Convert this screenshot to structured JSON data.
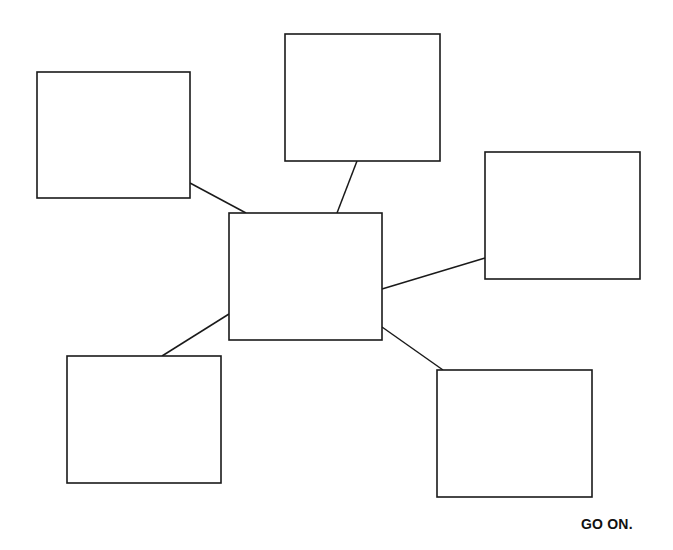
{
  "diagram": {
    "type": "web-organizer",
    "center_node": {
      "id": "center",
      "label": "",
      "x": 229,
      "y": 213,
      "w": 153,
      "h": 127
    },
    "nodes": [
      {
        "id": "top-left",
        "label": "",
        "x": 37,
        "y": 72,
        "w": 153,
        "h": 126
      },
      {
        "id": "top-center",
        "label": "",
        "x": 285,
        "y": 34,
        "w": 155,
        "h": 127
      },
      {
        "id": "right",
        "label": "",
        "x": 485,
        "y": 152,
        "w": 155,
        "h": 127
      },
      {
        "id": "bottom-left",
        "label": "",
        "x": 67,
        "y": 356,
        "w": 154,
        "h": 127
      },
      {
        "id": "bottom-right",
        "label": "",
        "x": 437,
        "y": 370,
        "w": 155,
        "h": 127
      }
    ],
    "edges": [
      {
        "from": "center",
        "to": "top-left",
        "x1": 246,
        "y1": 213,
        "x2": 190,
        "y2": 183
      },
      {
        "from": "center",
        "to": "top-center",
        "x1": 337,
        "y1": 213,
        "x2": 357,
        "y2": 161
      },
      {
        "from": "center",
        "to": "right",
        "x1": 382,
        "y1": 289,
        "x2": 485,
        "y2": 258
      },
      {
        "from": "center",
        "to": "bottom-left",
        "x1": 229,
        "y1": 314,
        "x2": 162,
        "y2": 356
      },
      {
        "from": "center",
        "to": "bottom-right",
        "x1": 382,
        "y1": 327,
        "x2": 443,
        "y2": 370
      }
    ],
    "stroke_color": "#1a1a1a"
  },
  "footer": {
    "go_on_label": "GO ON."
  }
}
